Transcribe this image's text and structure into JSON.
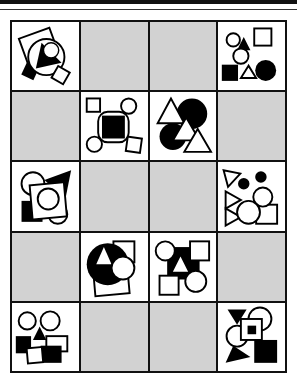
{
  "puzzle": {
    "rows": 5,
    "cols": 4,
    "colors": {
      "grid_line": "#111111",
      "empty_cell": "#d2d2d2",
      "filled_cell": "#ffffff",
      "ink": "#000000"
    },
    "cells": [
      {
        "r": 0,
        "c": 0,
        "type": "figure",
        "desc": "tilted square, circle with black triangle and small circle, black diamond, small white square"
      },
      {
        "r": 0,
        "c": 1,
        "type": "empty"
      },
      {
        "r": 0,
        "c": 2,
        "type": "empty"
      },
      {
        "r": 0,
        "c": 3,
        "type": "figure",
        "desc": "circles, square, black triangle, black square, white triangle, black circle"
      },
      {
        "r": 1,
        "c": 0,
        "type": "empty"
      },
      {
        "r": 1,
        "c": 1,
        "type": "figure",
        "desc": "black square ringed by circles and squares"
      },
      {
        "r": 1,
        "c": 2,
        "type": "figure",
        "desc": "white triangles over black circles"
      },
      {
        "r": 1,
        "c": 3,
        "type": "empty"
      },
      {
        "r": 2,
        "c": 0,
        "type": "figure",
        "desc": "circles, black triangle, black square behind white square with circle"
      },
      {
        "r": 2,
        "c": 1,
        "type": "empty"
      },
      {
        "r": 2,
        "c": 2,
        "type": "empty"
      },
      {
        "r": 2,
        "c": 3,
        "type": "figure",
        "desc": "white triangles, black dots, circles and square"
      },
      {
        "r": 3,
        "c": 0,
        "type": "empty"
      },
      {
        "r": 3,
        "c": 1,
        "type": "figure",
        "desc": "black circle with white triangle, white circle, squares"
      },
      {
        "r": 3,
        "c": 2,
        "type": "figure",
        "desc": "black square with white triangle, circles and squares at corners"
      },
      {
        "r": 3,
        "c": 3,
        "type": "empty"
      },
      {
        "r": 4,
        "c": 0,
        "type": "figure",
        "desc": "two circles, black triangle, black and white squares"
      },
      {
        "r": 4,
        "c": 1,
        "type": "empty"
      },
      {
        "r": 4,
        "c": 2,
        "type": "empty"
      },
      {
        "r": 4,
        "c": 3,
        "type": "figure",
        "desc": "black triangles, circles, square with black center, black square"
      }
    ]
  }
}
